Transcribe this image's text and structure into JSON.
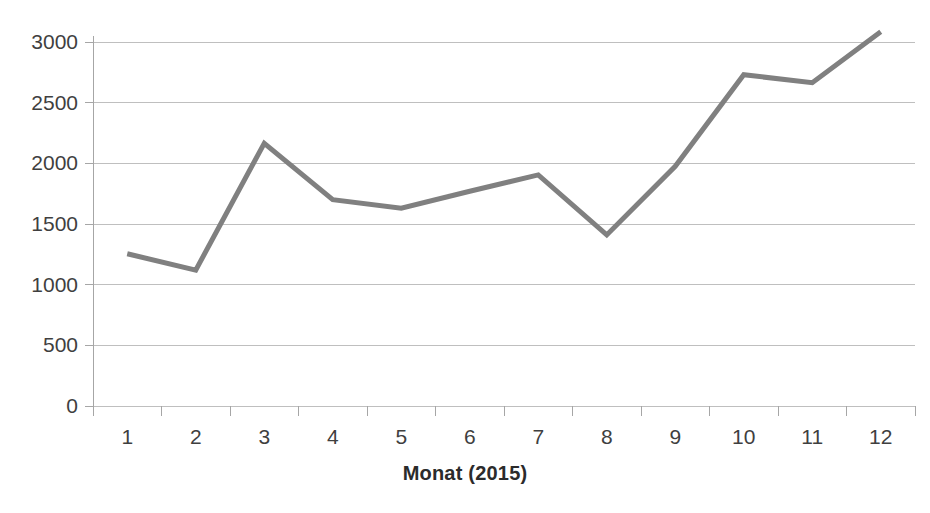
{
  "chart_data": {
    "type": "line",
    "title": "",
    "subtitle": "",
    "xlabel": "Monat (2015)",
    "ylabel": "",
    "categories": [
      "1",
      "2",
      "3",
      "4",
      "5",
      "6",
      "7",
      "8",
      "9",
      "10",
      "11",
      "12"
    ],
    "values": [
      1255,
      1120,
      2165,
      1700,
      1630,
      1770,
      1905,
      1410,
      1975,
      2730,
      2665,
      3085
    ],
    "series": [
      {
        "name": "",
        "values": [
          1255,
          1120,
          2165,
          1700,
          1630,
          1770,
          1905,
          1410,
          1975,
          2730,
          2665,
          3085
        ],
        "color": "#808080"
      }
    ],
    "ylim": [
      0,
      3000
    ],
    "yticks": [
      0,
      500,
      1000,
      1500,
      2000,
      2500,
      3000
    ],
    "ytick_labels": [
      "0",
      "500",
      "1000",
      "1500",
      "2000",
      "2500",
      "3000"
    ],
    "xtick_labels": [
      "1",
      "2",
      "3",
      "4",
      "5",
      "6",
      "7",
      "8",
      "9",
      "10",
      "11",
      "12"
    ],
    "grid": "horizontal",
    "legend": "none",
    "line_color": "#808080",
    "grid_color": "#bfbfbf",
    "axis_color": "#a6a6a6",
    "background": "#ffffff"
  },
  "axes": {
    "x_title": "Monat (2015)"
  }
}
